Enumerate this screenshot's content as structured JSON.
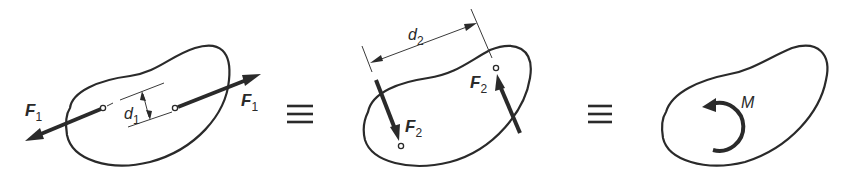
{
  "figure": {
    "panels": [
      {
        "id": "panel-1",
        "force_label": "F",
        "force_subscript": "1",
        "distance_label": "d",
        "distance_subscript": "1"
      },
      {
        "id": "panel-2",
        "force_label": "F",
        "force_subscript": "2",
        "distance_label": "d",
        "distance_subscript": "2"
      },
      {
        "id": "panel-3",
        "moment_label": "M"
      }
    ],
    "equivalence_symbol": "≡",
    "colors": {
      "ink": "#2a2a2a",
      "background": "#ffffff"
    }
  }
}
